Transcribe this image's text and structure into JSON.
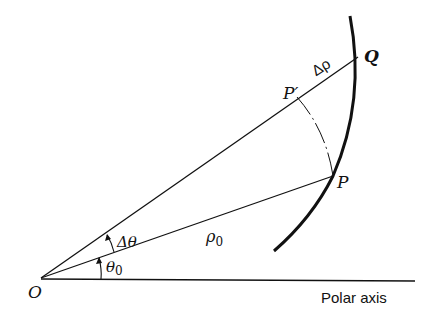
{
  "diagram": {
    "type": "polar-coordinate-increment",
    "points": {
      "origin": {
        "label": "O"
      },
      "P": {
        "label": "P"
      },
      "P_prime": {
        "label": "P′"
      },
      "Q": {
        "label": "Q"
      }
    },
    "labels": {
      "delta_rho": "Δρ",
      "rho0": "ρ",
      "rho0_sub": "0",
      "theta0": "θ",
      "theta0_sub": "0",
      "delta_theta": "Δθ",
      "polar_axis": "Polar axis"
    },
    "colors": {
      "stroke": "#111111",
      "background": "#ffffff"
    }
  }
}
